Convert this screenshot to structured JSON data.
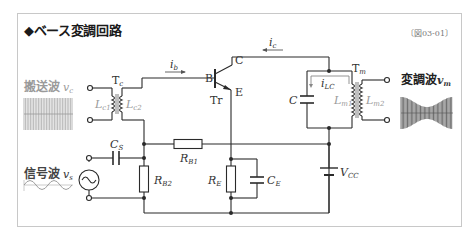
{
  "figure": {
    "title": "◆ベース変調回路",
    "figure_id": "〔図03-01〕"
  },
  "labels": {
    "carrier_wave": "搬送波",
    "carrier_symbol": "v",
    "carrier_sub": "c",
    "signal_wave": "信号波",
    "signal_symbol": "v",
    "signal_sub": "s",
    "modulated_wave": "変調波",
    "modulated_symbol": "v",
    "modulated_sub": "m"
  },
  "components": {
    "input_transformer": {
      "name": "T",
      "sub": "c",
      "primary": "L",
      "primary_sub": "c1",
      "secondary": "L",
      "secondary_sub": "c2"
    },
    "output_transformer": {
      "name": "T",
      "sub": "m",
      "primary": "L",
      "primary_sub": "m1",
      "secondary": "L",
      "secondary_sub": "m2"
    },
    "transistor": {
      "name": "Tr",
      "base": "B",
      "collector": "C",
      "emitter": "E"
    },
    "coupling_capacitor": {
      "name": "C",
      "sub": "S"
    },
    "bias_resistor_1": {
      "name": "R",
      "sub": "B1"
    },
    "bias_resistor_2": {
      "name": "R",
      "sub": "B2"
    },
    "emitter_resistor": {
      "name": "R",
      "sub": "E"
    },
    "emitter_capacitor": {
      "name": "C",
      "sub": "E"
    },
    "tank_capacitor": {
      "name": "C"
    },
    "supply": {
      "name": "V",
      "sub": "CC"
    }
  },
  "currents": {
    "base": {
      "name": "i",
      "sub": "b"
    },
    "collector": {
      "name": "i",
      "sub": "c"
    },
    "tank": {
      "name": "i",
      "sub": "LC"
    }
  },
  "colors": {
    "wire": "#2a2a2a",
    "waveform": "#555555",
    "label_gray": "#9a9a9a",
    "frame": "#c8c8c8"
  }
}
